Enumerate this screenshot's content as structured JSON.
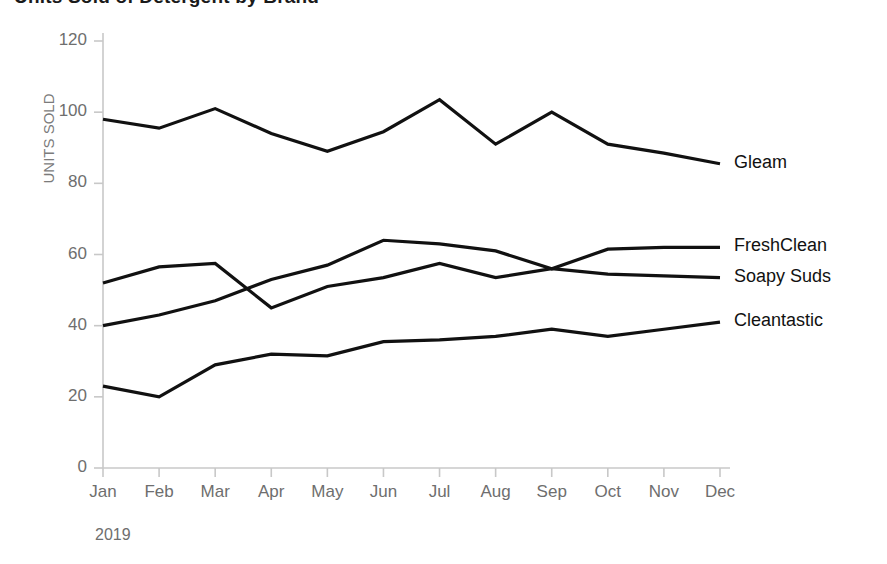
{
  "chart_data": {
    "type": "line",
    "title": "Units Sold of Detergent by Brand",
    "xlabel": "2019",
    "ylabel": "UNITS SOLD",
    "ylim": [
      0,
      120
    ],
    "ytick_values": [
      "0",
      "20",
      "40",
      "60",
      "80",
      "100",
      "120"
    ],
    "grid": false,
    "legend_position": "right-inline-end-of-line",
    "categories": [
      "Jan",
      "Feb",
      "Mar",
      "Apr",
      "May",
      "Jun",
      "Jul",
      "Aug",
      "Sep",
      "Oct",
      "Nov",
      "Dec"
    ],
    "series": [
      {
        "name": "Gleam",
        "color": "#111111",
        "values": [
          98,
          95.5,
          101,
          94,
          89,
          94.5,
          103.5,
          91,
          100,
          91,
          88.5,
          85.5
        ]
      },
      {
        "name": "FreshClean",
        "color": "#111111",
        "values": [
          40,
          43,
          47,
          53,
          57,
          64,
          63,
          61,
          56,
          61.5,
          62,
          62
        ]
      },
      {
        "name": "Soapy Suds",
        "color": "#111111",
        "values": [
          52,
          56.5,
          57.5,
          45,
          51,
          53.5,
          57.5,
          53.5,
          56,
          54.5,
          54,
          53.5
        ]
      },
      {
        "name": "Cleantastic",
        "color": "#111111",
        "values": [
          23,
          20,
          29,
          32,
          31.5,
          35.5,
          36,
          37,
          39,
          37,
          39,
          41
        ]
      }
    ]
  },
  "axis_style": {
    "axis_color": "#c8c8c8",
    "tick_color": "#c8c8c8",
    "line_color": "#111111"
  }
}
